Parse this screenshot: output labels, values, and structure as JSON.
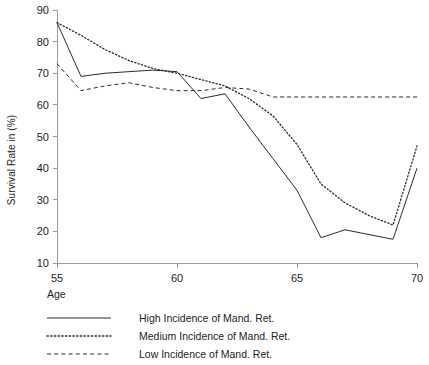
{
  "chart_data": {
    "type": "line",
    "title": "",
    "xlabel": "Age",
    "ylabel": "Survival Rate in (%)",
    "xlim": [
      55,
      70
    ],
    "ylim": [
      10,
      90
    ],
    "xticks": [
      55,
      60,
      65,
      70
    ],
    "yticks": [
      10,
      20,
      30,
      40,
      50,
      60,
      70,
      80,
      90
    ],
    "grid": false,
    "legend_position": "below-axes-left",
    "x": [
      55,
      56,
      57,
      58,
      59,
      60,
      61,
      62,
      63,
      64,
      65,
      66,
      67,
      68,
      69,
      70
    ],
    "series": [
      {
        "name": "High Incidence of Mand. Ret.",
        "style": "solid",
        "values": [
          86,
          69,
          70,
          70.5,
          71,
          70.5,
          62,
          63.5,
          53,
          43,
          33,
          18,
          20.5,
          19,
          17.5,
          40
        ]
      },
      {
        "name": "Medium Incidence of Mand. Ret.",
        "style": "dotted",
        "values": [
          86,
          82,
          77.5,
          74,
          71.5,
          70,
          68,
          66,
          62,
          56.5,
          47.5,
          35,
          29,
          25,
          22,
          47
        ]
      },
      {
        "name": "Low Incidence of Mand. Ret.",
        "style": "dashed",
        "values": [
          73,
          64.5,
          66,
          67,
          65.5,
          64.5,
          64.5,
          65.5,
          65,
          62.5,
          62.5,
          62.5,
          62.5,
          62.5,
          62.5,
          62.5
        ]
      }
    ]
  },
  "axes": {
    "y_label": "Survival Rate in (%)",
    "x_axis_caption": "Age",
    "y_tick_labels": [
      "90",
      "80",
      "70",
      "60",
      "50",
      "40",
      "30",
      "20",
      "10"
    ],
    "x_tick_labels": [
      "55",
      "60",
      "65",
      "70"
    ]
  },
  "legend": {
    "title": "Age",
    "entries": [
      {
        "label": "High Incidence of Mand. Ret.",
        "style": "solid"
      },
      {
        "label": "Medium Incidence of Mand. Ret.",
        "style": "dotted"
      },
      {
        "label": "Low Incidence of Mand. Ret.",
        "style": "dashed"
      }
    ]
  },
  "colors": {
    "ink": "#2b2b2b",
    "axis": "#9a9a9a",
    "background": "#ffffff"
  }
}
